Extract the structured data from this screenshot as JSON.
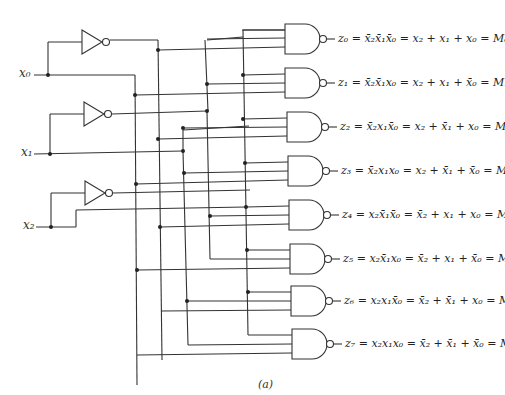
{
  "figure": {
    "caption": "(a)",
    "inputs": [
      {
        "name": "x0",
        "label": "x₀"
      },
      {
        "name": "x1",
        "label": "x₁"
      },
      {
        "name": "x2",
        "label": "x₂"
      }
    ],
    "outputs": [
      {
        "label": "z₀ = x̄₂x̄₁x̄₀ = x₂ + x₁ + x₀ = M₀",
        "z": "z₀",
        "nand": "x̄₂x̄₁x̄₀",
        "sum": "x₂ + x₁ + x₀",
        "maxterm": "M₀"
      },
      {
        "label": "z₁ = x̄₂x̄₁x₀ = x₂ + x₁ + x̄₀ = M₁",
        "z": "z₁",
        "nand": "x̄₂x̄₁x₀",
        "sum": "x₂ + x₁ + x̄₀",
        "maxterm": "M₁"
      },
      {
        "label": "z₂ = x̄₂x₁x̄₀ = x₂ + x̄₁ + x₀ = M₂",
        "z": "z₂",
        "nand": "x̄₂x₁x̄₀",
        "sum": "x₂ + x̄₁ + x₀",
        "maxterm": "M₂"
      },
      {
        "label": "z₃ = x̄₂x₁x₀ = x₂ + x̄₁ + x̄₀ = M₃",
        "z": "z₃",
        "nand": "x̄₂x₁x₀",
        "sum": "x₂ + x̄₁ + x̄₀",
        "maxterm": "M₃"
      },
      {
        "label": "z₄ = x₂x̄₁x̄₀ = x̄₂ + x₁ + x₀ = M₄",
        "z": "z₄",
        "nand": "x₂x̄₁x̄₀",
        "sum": "x̄₂ + x₁ + x₀",
        "maxterm": "M₄"
      },
      {
        "label": "z₅ = x₂x̄₁x₀ = x̄₂ + x₁ + x̄₀ = M₅",
        "z": "z₅",
        "nand": "x₂x̄₁x₀",
        "sum": "x̄₂ + x₁ + x̄₀",
        "maxterm": "M₅"
      },
      {
        "label": "z₆ = x₂x₁x̄₀ = x̄₂ + x̄₁ + x₀ = M₆",
        "z": "z₆",
        "nand": "x₂x₁x̄₀",
        "sum": "x̄₂ + x̄₁ + x₀",
        "maxterm": "M₆"
      },
      {
        "label": "z₇ = x₂x₁x₀ = x̄₂ + x̄₁ + x̄₀ = M₇",
        "z": "z₇",
        "nand": "x₂x₁x₀",
        "sum": "x̄₂ + x̄₁ + x̄₀",
        "maxterm": "M₇"
      }
    ],
    "components": {
      "inverters": 3,
      "nand_gates": 8,
      "nand_inputs": 3
    }
  }
}
